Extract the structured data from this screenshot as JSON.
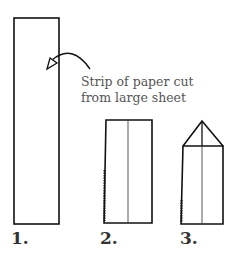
{
  "annotation": {
    "line1": "Strip of paper cut",
    "line2": "from large sheet"
  },
  "steps": [
    {
      "label": "1."
    },
    {
      "label": "2."
    },
    {
      "label": "3."
    }
  ],
  "colors": {
    "stroke": "#111111",
    "text": "#555555"
  }
}
